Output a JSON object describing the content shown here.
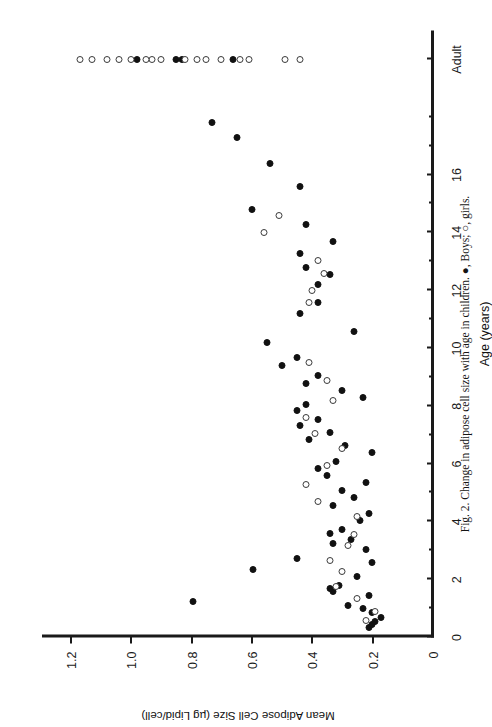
{
  "figure": {
    "caption": "Fig. 2. Change in adipose cell size with age in children. ●, Boys; ○, girls."
  },
  "chart_data": {
    "type": "scatter",
    "title": "",
    "xlabel": "Age (years)",
    "ylabel": "Mean Adipose Cell Size (µg Lipid/cell)",
    "xlim": [
      0,
      21
    ],
    "ylim": [
      0,
      1.3
    ],
    "x_tick_values": [
      0,
      1,
      2,
      3,
      4,
      5,
      6,
      7,
      8,
      9,
      10,
      11,
      12,
      13,
      14,
      15,
      16,
      17,
      18,
      20
    ],
    "x_tick_labels": [
      "0",
      "",
      "2",
      "",
      "4",
      "",
      "6",
      "",
      "8",
      "",
      "10",
      "",
      "12",
      "",
      "14",
      "",
      "16",
      "",
      "",
      "Adult"
    ],
    "y_ticks": [
      0,
      0.2,
      0.4,
      0.6,
      0.8,
      1.0,
      1.2
    ],
    "y_tick_labels": [
      "0",
      "0.2",
      "0.4",
      "0.6",
      "0.8",
      "1.0",
      "1.2"
    ],
    "grid": false,
    "legend_position": "caption",
    "rotation_deg": -90,
    "series": [
      {
        "name": "Boys",
        "marker": "filled-circle",
        "color": "#111111",
        "points": [
          [
            0.35,
            0.215
          ],
          [
            0.45,
            0.205
          ],
          [
            0.55,
            0.195
          ],
          [
            0.7,
            0.175
          ],
          [
            0.85,
            0.205
          ],
          [
            1.0,
            0.235
          ],
          [
            1.1,
            0.285
          ],
          [
            1.25,
            0.8
          ],
          [
            1.45,
            0.215
          ],
          [
            1.6,
            0.335
          ],
          [
            1.7,
            0.345
          ],
          [
            1.8,
            0.315
          ],
          [
            2.1,
            0.255
          ],
          [
            2.35,
            0.6
          ],
          [
            2.6,
            0.205
          ],
          [
            2.75,
            0.455
          ],
          [
            3.05,
            0.225
          ],
          [
            3.25,
            0.335
          ],
          [
            3.4,
            0.275
          ],
          [
            3.6,
            0.345
          ],
          [
            3.75,
            0.305
          ],
          [
            4.05,
            0.245
          ],
          [
            4.3,
            0.215
          ],
          [
            4.55,
            0.335
          ],
          [
            4.85,
            0.265
          ],
          [
            5.1,
            0.305
          ],
          [
            5.35,
            0.225
          ],
          [
            5.6,
            0.355
          ],
          [
            5.85,
            0.385
          ],
          [
            6.1,
            0.325
          ],
          [
            6.4,
            0.205
          ],
          [
            6.65,
            0.295
          ],
          [
            6.85,
            0.415
          ],
          [
            7.1,
            0.345
          ],
          [
            7.35,
            0.445
          ],
          [
            7.55,
            0.385
          ],
          [
            7.85,
            0.455
          ],
          [
            8.05,
            0.425
          ],
          [
            8.3,
            0.235
          ],
          [
            8.55,
            0.305
          ],
          [
            8.8,
            0.425
          ],
          [
            9.05,
            0.385
          ],
          [
            9.4,
            0.505
          ],
          [
            9.7,
            0.455
          ],
          [
            10.2,
            0.555
          ],
          [
            10.6,
            0.265
          ],
          [
            11.2,
            0.445
          ],
          [
            11.6,
            0.385
          ],
          [
            12.2,
            0.385
          ],
          [
            12.55,
            0.345
          ],
          [
            12.8,
            0.425
          ],
          [
            13.3,
            0.445
          ],
          [
            13.7,
            0.335
          ],
          [
            14.3,
            0.425
          ],
          [
            14.8,
            0.605
          ],
          [
            15.6,
            0.445
          ],
          [
            16.4,
            0.545
          ],
          [
            17.3,
            0.655
          ],
          [
            17.8,
            0.735
          ],
          [
            20.0,
            0.665
          ],
          [
            20.0,
            0.835
          ],
          [
            20.0,
            0.855
          ],
          [
            20.0,
            0.985
          ]
        ]
      },
      {
        "name": "girls",
        "marker": "open-circle",
        "color": "#3a3a3a",
        "points": [
          [
            0.6,
            0.225
          ],
          [
            0.9,
            0.195
          ],
          [
            1.35,
            0.255
          ],
          [
            1.75,
            0.325
          ],
          [
            2.3,
            0.305
          ],
          [
            2.65,
            0.345
          ],
          [
            3.2,
            0.285
          ],
          [
            3.55,
            0.265
          ],
          [
            4.2,
            0.255
          ],
          [
            4.7,
            0.385
          ],
          [
            5.3,
            0.425
          ],
          [
            5.95,
            0.355
          ],
          [
            6.55,
            0.305
          ],
          [
            7.05,
            0.395
          ],
          [
            7.6,
            0.425
          ],
          [
            8.2,
            0.335
          ],
          [
            8.9,
            0.355
          ],
          [
            9.5,
            0.415
          ],
          [
            11.6,
            0.415
          ],
          [
            12.0,
            0.405
          ],
          [
            12.6,
            0.365
          ],
          [
            13.05,
            0.385
          ],
          [
            14.0,
            0.565
          ],
          [
            14.6,
            0.515
          ],
          [
            20.0,
            0.445
          ],
          [
            20.0,
            0.495
          ],
          [
            20.0,
            0.615
          ],
          [
            20.0,
            0.645
          ],
          [
            20.0,
            0.705
          ],
          [
            20.0,
            0.755
          ],
          [
            20.0,
            0.785
          ],
          [
            20.0,
            0.825
          ],
          [
            20.0,
            0.905
          ],
          [
            20.0,
            0.935
          ],
          [
            20.0,
            0.955
          ],
          [
            20.0,
            1.005
          ],
          [
            20.0,
            1.045
          ],
          [
            20.0,
            1.085
          ],
          [
            20.0,
            1.135
          ],
          [
            20.0,
            1.175
          ]
        ]
      }
    ]
  }
}
